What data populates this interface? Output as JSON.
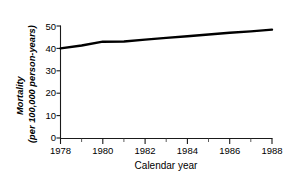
{
  "chart_data": {
    "type": "line",
    "title": "",
    "subtitle": "",
    "xlabel": "Calendar year",
    "ylabel_line1": "Mortality",
    "ylabel_line2": "(per 100,000 person-years)",
    "ylabel": "Mortality (per 100,000 person-years)",
    "xlim": [
      1978,
      1988
    ],
    "ylim": [
      0,
      50
    ],
    "grid": false,
    "legend": false,
    "legend_position": "none",
    "x_tick_labels": [
      "1978",
      "1980",
      "1982",
      "1984",
      "1986",
      "1988"
    ],
    "x_tick_values": [
      1978,
      1980,
      1982,
      1984,
      1986,
      1988
    ],
    "x_minor_tick_values": [
      1979,
      1981,
      1983,
      1985,
      1987
    ],
    "y_tick_labels": [
      "0",
      "10",
      "20",
      "30",
      "40",
      "50"
    ],
    "y_tick_values": [
      0,
      10,
      20,
      30,
      40,
      50
    ],
    "x": [
      1978,
      1979,
      1980,
      1981,
      1982,
      1983,
      1984,
      1985,
      1986,
      1987,
      1988
    ],
    "values": [
      40.0,
      41.3,
      43.0,
      43.1,
      43.9,
      44.7,
      45.4,
      46.2,
      47.0,
      47.6,
      48.4
    ],
    "series": [
      {
        "name": "Mortality",
        "color": "#000000",
        "values": [
          40.0,
          41.3,
          43.0,
          43.1,
          43.9,
          44.7,
          45.4,
          46.2,
          47.0,
          47.6,
          48.4
        ]
      }
    ],
    "annotations": []
  }
}
